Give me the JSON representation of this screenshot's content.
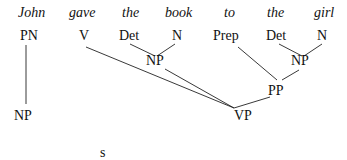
{
  "diagram": {
    "type": "partial parse tree (bottom-up chart parse)",
    "sentence": [
      "John",
      "gave",
      "the",
      "book",
      "to",
      "the",
      "girl"
    ],
    "words": [
      {
        "text": "John",
        "x": 18,
        "y": 5
      },
      {
        "text": "gave",
        "x": 69,
        "y": 5
      },
      {
        "text": "the",
        "x": 122,
        "y": 5
      },
      {
        "text": "book",
        "x": 165,
        "y": 5
      },
      {
        "text": "to",
        "x": 224,
        "y": 5
      },
      {
        "text": "the",
        "x": 267,
        "y": 5
      },
      {
        "text": "girl",
        "x": 314,
        "y": 5
      }
    ],
    "nodes": [
      {
        "id": "PN",
        "label": "PN",
        "x": 20,
        "y": 28
      },
      {
        "id": "V",
        "label": "V",
        "x": 79,
        "y": 28
      },
      {
        "id": "Det1",
        "label": "Det",
        "x": 119,
        "y": 28
      },
      {
        "id": "N1",
        "label": "N",
        "x": 172,
        "y": 28
      },
      {
        "id": "NP1",
        "label": "NP",
        "x": 146,
        "y": 53
      },
      {
        "id": "Prep",
        "label": "Prep",
        "x": 213,
        "y": 28
      },
      {
        "id": "Det2",
        "label": "Det",
        "x": 266,
        "y": 28
      },
      {
        "id": "N2",
        "label": "N",
        "x": 317,
        "y": 28
      },
      {
        "id": "NP2",
        "label": "NP",
        "x": 291,
        "y": 53
      },
      {
        "id": "PP",
        "label": "PP",
        "x": 268,
        "y": 83
      },
      {
        "id": "VP",
        "label": "VP",
        "x": 234,
        "y": 108
      },
      {
        "id": "NP0",
        "label": "NP",
        "x": 14,
        "y": 108
      },
      {
        "id": "S",
        "label": "s",
        "x": 100,
        "y": 145
      }
    ],
    "edges": [
      {
        "from": "PN",
        "to": "NP0",
        "x1": 26,
        "y1": 45,
        "x2": 26,
        "y2": 104
      },
      {
        "from": "Det1",
        "to": "NP1",
        "x1": 130,
        "y1": 44,
        "x2": 155,
        "y2": 56
      },
      {
        "from": "N1",
        "to": "NP1",
        "x1": 175,
        "y1": 44,
        "x2": 157,
        "y2": 56
      },
      {
        "from": "V",
        "to": "VP",
        "x1": 86,
        "y1": 47,
        "x2": 234,
        "y2": 108
      },
      {
        "from": "NP1",
        "to": "VP",
        "x1": 165,
        "y1": 69,
        "x2": 234,
        "y2": 108
      },
      {
        "from": "Prep",
        "to": "PP",
        "x1": 238,
        "y1": 47,
        "x2": 277,
        "y2": 80
      },
      {
        "from": "Det2",
        "to": "NP2",
        "x1": 279,
        "y1": 44,
        "x2": 302,
        "y2": 56
      },
      {
        "from": "N2",
        "to": "NP2",
        "x1": 322,
        "y1": 44,
        "x2": 304,
        "y2": 56
      },
      {
        "from": "NP2",
        "to": "PP",
        "x1": 299,
        "y1": 70,
        "x2": 282,
        "y2": 80
      },
      {
        "from": "PP",
        "to": "VP",
        "x1": 270,
        "y1": 97,
        "x2": 234,
        "y2": 108
      }
    ]
  }
}
